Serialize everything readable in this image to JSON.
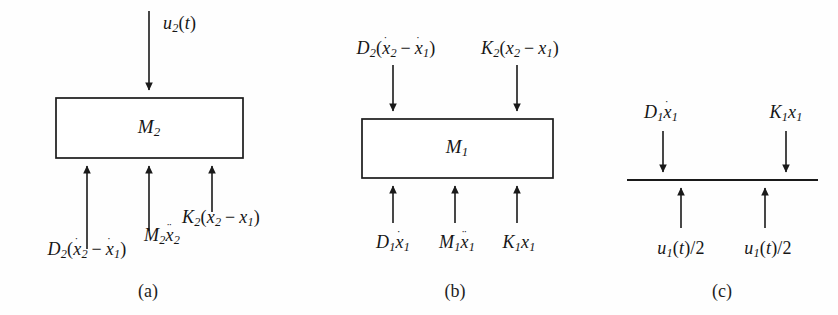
{
  "figure": {
    "background_color": "#fefefe",
    "line_color": "#1a1a1a"
  },
  "panels": [
    {
      "id": "a",
      "caption": "(a)",
      "mass_label": "M2",
      "mass_label_base": "M",
      "mass_label_sub": "2",
      "top_forces": [
        {
          "name": "u2(t)",
          "text": "u2(t)",
          "direction": "down"
        }
      ],
      "bottom_forces": [
        {
          "name": "D2(x2dot - x1dot)",
          "text": "D2(ẋ2 − ẋ1)",
          "direction": "up"
        },
        {
          "name": "M2x2ddot",
          "text": "M2ẍ2",
          "direction": "up"
        },
        {
          "name": "K2(x2 - x1)",
          "text": "K2(x2 − x1)",
          "direction": "up"
        }
      ]
    },
    {
      "id": "b",
      "caption": "(b)",
      "mass_label": "M1",
      "mass_label_base": "M",
      "mass_label_sub": "1",
      "top_forces": [
        {
          "name": "D2(x2dot - x1dot)",
          "text": "D2(ẋ2 − ẋ1)",
          "direction": "down"
        },
        {
          "name": "K2(x2 - x1)",
          "text": "K2(x2 − x1)",
          "direction": "down"
        }
      ],
      "bottom_forces": [
        {
          "name": "D1x1dot",
          "text": "D1ẋ1",
          "direction": "up"
        },
        {
          "name": "M1x1ddot",
          "text": "M1ẍ1",
          "direction": "up"
        },
        {
          "name": "K1x1",
          "text": "K1x1",
          "direction": "up"
        }
      ]
    },
    {
      "id": "c",
      "caption": "(c)",
      "mass_label": "",
      "top_forces": [
        {
          "name": "D1x1dot",
          "text": "D1ẋ1",
          "direction": "down"
        },
        {
          "name": "K1x1",
          "text": "K1x1",
          "direction": "down"
        }
      ],
      "bottom_forces": [
        {
          "name": "u1(t)/2 left",
          "text": "u1(t)/2",
          "direction": "up"
        },
        {
          "name": "u1(t)/2 right",
          "text": "u1(t)/2",
          "direction": "up"
        }
      ]
    }
  ],
  "labels": {
    "a_u2t": "u",
    "a_u2t_sub": "2",
    "a_u2t_tail": "(t)",
    "a_D2": "D",
    "a_D2_sub": "2",
    "a_M2a": "M",
    "a_M2a_sub": "2",
    "a_K2": "K",
    "a_K2_sub": "2",
    "b_D2": "D",
    "b_K2": "K",
    "b_D1": "D",
    "b_M1": "M",
    "b_K1": "K",
    "c_D1": "D",
    "c_K1": "K",
    "c_u1": "u",
    "captions": [
      "(a)",
      "(b)",
      "(c)"
    ]
  }
}
